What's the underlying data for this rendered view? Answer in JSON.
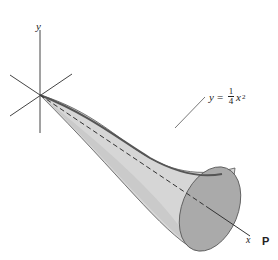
{
  "figure": {
    "axes": {
      "y_label": "y",
      "x_label": "x"
    },
    "curve_label": {
      "lhs": "y",
      "equals": "=",
      "numerator": "1",
      "denominator": "4",
      "variable": "x",
      "exponent": "2"
    },
    "cropped_text": "P",
    "colors": {
      "surface": "#d9d9d9",
      "surface_shade": "#c8c8c8",
      "end_cap": "#a9a9a9",
      "lines": "#333333"
    }
  }
}
